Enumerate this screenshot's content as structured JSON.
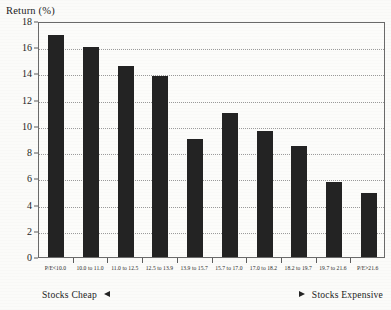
{
  "chart_data": {
    "type": "bar",
    "title": "",
    "xlabel": "",
    "ylabel": "Return (%)",
    "ylim": [
      0,
      18
    ],
    "yticks": [
      0,
      2,
      4,
      6,
      8,
      10,
      12,
      14,
      16,
      18
    ],
    "grid": true,
    "legend": "none",
    "categories": [
      "P/E<10.0",
      "10.0 to 11.0",
      "11.0 to 12.5",
      "12.5 to 13.9",
      "13.9 to 15.7",
      "15.7 to 17.0",
      "17.0 to 18.2",
      "18.2 to 19.7",
      "19.7 to 21.6",
      "P/E>21.6"
    ],
    "values": [
      16.9,
      16.0,
      14.6,
      13.8,
      9.0,
      11.0,
      9.6,
      8.5,
      5.7,
      4.9
    ],
    "annotations": [
      {
        "text": "Stocks Cheap",
        "marker": "left-triangle",
        "position": "bottom-left"
      },
      {
        "text": "Stocks Expensive",
        "marker": "right-triangle",
        "position": "bottom-right"
      }
    ],
    "bar_color": "#232323"
  },
  "axis": {
    "y_title": "Return (%)"
  },
  "footer": {
    "cheap_label": "Stocks Cheap",
    "expensive_label": "Stocks Expensive"
  }
}
